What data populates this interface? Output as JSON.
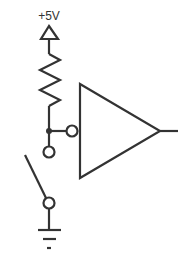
{
  "diagram": {
    "type": "circuit-schematic",
    "supply_label": "+5V",
    "components": [
      {
        "id": "vcc",
        "kind": "power-supply-symbol",
        "label": "+5V"
      },
      {
        "id": "r1",
        "kind": "resistor",
        "label": ""
      },
      {
        "id": "junction",
        "kind": "junction-dot"
      },
      {
        "id": "inverter",
        "kind": "inverting-buffer",
        "input": "inverting bubble"
      },
      {
        "id": "sw1",
        "kind": "spst-switch",
        "state": "open"
      },
      {
        "id": "gnd",
        "kind": "ground-symbol"
      }
    ],
    "colors": {
      "line": "#333333",
      "background": "#ffffff"
    }
  }
}
